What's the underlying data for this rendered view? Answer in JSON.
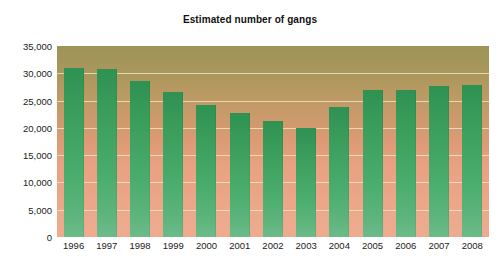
{
  "chart_data": {
    "type": "bar",
    "title": "Estimated number of gangs",
    "xlabel": "",
    "ylabel": "",
    "categories": [
      "1996",
      "1997",
      "1998",
      "1999",
      "2000",
      "2001",
      "2002",
      "2003",
      "2004",
      "2005",
      "2006",
      "2007",
      "2008"
    ],
    "values": [
      31000,
      30700,
      28500,
      26500,
      24100,
      22800,
      21200,
      20000,
      23800,
      26900,
      26900,
      27700,
      27900
    ],
    "ylim": [
      0,
      35000
    ],
    "yticks": [
      0,
      5000,
      10000,
      15000,
      20000,
      25000,
      30000,
      35000
    ],
    "ytick_labels": [
      "0",
      "5,000",
      "10,000",
      "15,000",
      "20,000",
      "25,000",
      "30,000",
      "35,000"
    ],
    "grid": true,
    "legend": false,
    "series": [
      {
        "name": "Estimated number of gangs",
        "values": [
          31000,
          30700,
          28500,
          26500,
          24100,
          22800,
          21200,
          20000,
          23800,
          26900,
          26900,
          27700,
          27900
        ]
      }
    ],
    "colors": {
      "bar_top": "#2f9152",
      "bar_bottom": "#6cbb8a",
      "plot_background_top": "#9d9459",
      "plot_background_bottom": "#eeab8f",
      "gridline": "#f0e3c6",
      "text": "#1b1b1b",
      "page_background": "#ffffff"
    }
  }
}
